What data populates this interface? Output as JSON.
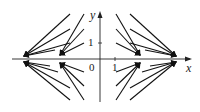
{
  "diagram": {
    "type": "vector-field",
    "axes": {
      "x_label": "x",
      "y_label": "y",
      "origin_label": "0",
      "x_tick_label": "1",
      "y_tick_label": "1"
    },
    "colors": {
      "ink": "#111111",
      "background": "#ffffff"
    },
    "clusters": [
      {
        "name": "outer-left",
        "tip_x": 24
      },
      {
        "name": "inner-left",
        "tip_x": 60
      },
      {
        "name": "inner-right",
        "tip_x": 140
      },
      {
        "name": "outer-right",
        "tip_x": 176
      }
    ]
  }
}
